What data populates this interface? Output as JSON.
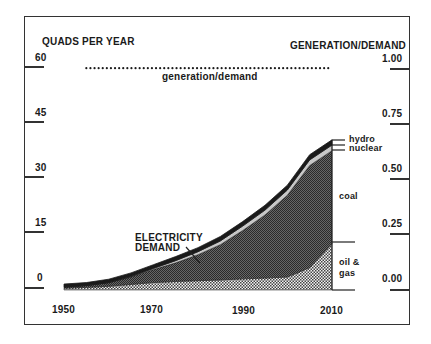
{
  "chart_data": {
    "type": "area",
    "title": "",
    "ylabel": "QUADS PER YEAR",
    "ylabel_right": "GENERATION/DEMAND",
    "xlabel": "",
    "x_ticks": [
      "1950",
      "1970",
      "1990",
      "2010"
    ],
    "y_ticks": [
      "0",
      "15",
      "30",
      "45",
      "60"
    ],
    "y_right_ticks": [
      "0.00",
      "0.25",
      "0.50",
      "0.75",
      "1.00"
    ],
    "ylim": [
      0,
      60
    ],
    "ylim_right": [
      0,
      1.0
    ],
    "x": [
      1950,
      1955,
      1960,
      1965,
      1970,
      1975,
      1980,
      1985,
      1990,
      1995,
      2000,
      2005,
      2010
    ],
    "series": [
      {
        "name": "oil & gas",
        "values": [
          0.5,
          0.7,
          1.0,
          1.5,
          2.0,
          2.3,
          2.5,
          2.7,
          3.0,
          3.2,
          3.5,
          6.0,
          12.5
        ]
      },
      {
        "name": "coal",
        "values": [
          0.3,
          0.5,
          1.0,
          2.0,
          3.5,
          5.0,
          7.0,
          9.5,
          13.0,
          17.0,
          22.0,
          27.5,
          25.0
        ]
      },
      {
        "name": "nuclear",
        "values": [
          0.0,
          0.0,
          0.0,
          0.1,
          0.3,
          0.6,
          0.8,
          1.0,
          1.2,
          1.3,
          1.4,
          1.5,
          1.5
        ]
      },
      {
        "name": "hydro",
        "values": [
          0.8,
          0.8,
          0.9,
          1.0,
          1.0,
          1.1,
          1.1,
          1.2,
          1.2,
          1.3,
          1.3,
          1.4,
          1.4
        ]
      }
    ],
    "generation_demand": {
      "name": "generation/demand",
      "x_range": [
        1955,
        2010
      ],
      "value": 0.99
    },
    "annotations": [
      "ELECTRICITY DEMAND",
      "generation/demand",
      "hydro",
      "nuclear",
      "coal",
      "oil & gas"
    ],
    "grid": false,
    "legend_position": "inline-right"
  },
  "labels": {
    "left_axis_title": "QUADS PER YEAR",
    "right_axis_title": "GENERATION/DEMAND",
    "gen_demand": "generation/demand",
    "demand_line1": "ELECTRICITY",
    "demand_line2": "DEMAND",
    "hydro": "hydro",
    "nuclear": "nuclear",
    "coal": "coal",
    "oil_line1": "oil &",
    "oil_line2": "gas"
  },
  "colors": {
    "coal": "#555555",
    "oil_gas": "#dddddd",
    "nuclear": "#bbbbbb",
    "hydro": "#1a1a1a",
    "frame": "#333333"
  }
}
